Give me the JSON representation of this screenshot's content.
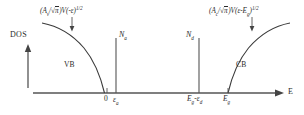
{
  "figure": {
    "axes": {
      "x_label": "E",
      "y_label": "DOS"
    },
    "band_labels": {
      "valence": "VB",
      "conduction": "CB"
    },
    "impurity_labels": {
      "acceptor": "N",
      "acceptor_sub": "a",
      "donor": "N",
      "donor_sub": "d"
    },
    "ticks": [
      {
        "id": "origin",
        "text": "0",
        "sub": "",
        "x": 107
      },
      {
        "id": "epsilon-a",
        "text": "ε",
        "sub": "a",
        "x": 116
      },
      {
        "id": "eg-minus-epsilon-d",
        "text": "E",
        "sub": "g",
        "text2": "-ε",
        "sub2": "d",
        "x": 199
      },
      {
        "id": "eg",
        "text": "E",
        "sub": "g",
        "x": 228
      }
    ],
    "formulas": {
      "valence": {
        "open_paren": "(",
        "amplitude": "A",
        "amplitude_sub": "v",
        "divider": "/",
        "sqrt_symbol": "√",
        "pi": "π",
        "close_paren": ")",
        "volume": "V",
        "arg_open": "(",
        "arg": "-ε",
        "arg_close": ")",
        "exponent": "1/2",
        "plain": "(Aᵥ/√π)V(-ε)¹ᐟ²"
      },
      "conduction": {
        "open_paren": "(",
        "amplitude": "A",
        "amplitude_sub": "c",
        "divider": "/",
        "sqrt_symbol": "√",
        "pi": "π",
        "close_paren": ")",
        "volume": "V",
        "arg_open": "(",
        "arg": "ε-E",
        "arg_sub": "g",
        "arg_close": ")",
        "exponent": "1/2",
        "plain": "(Aᶜ/√π)V(ε-Eᵍ)¹ᐟ²"
      }
    },
    "colors": {
      "line": "#555555",
      "text": "#2a2a2a",
      "background": "#ffffff",
      "curve": "#3a3a3a"
    }
  }
}
